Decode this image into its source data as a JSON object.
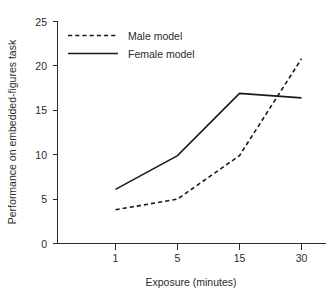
{
  "chart_data": {
    "type": "line",
    "title": "",
    "subtitle": "",
    "xlabel": "Exposure (minutes)",
    "ylabel": "Performance on embedded-figures task",
    "categories": [
      "1",
      "5",
      "15",
      "30"
    ],
    "x_tick_labels": [
      "1",
      "5",
      "15",
      "30"
    ],
    "y_tick_labels": [
      "0",
      "5",
      "10",
      "15",
      "20",
      "25"
    ],
    "y_ticks": [
      0,
      5,
      10,
      15,
      20,
      25
    ],
    "ylim": [
      0,
      25
    ],
    "grid": false,
    "legend_position": "top-left-inside",
    "series": [
      {
        "name": "Male model",
        "style": "dashed",
        "color": "#1a1a1a",
        "values": [
          3.8,
          5.0,
          9.9,
          20.8
        ]
      },
      {
        "name": "Female model",
        "style": "solid",
        "color": "#1a1a1a",
        "values": [
          6.1,
          9.9,
          16.9,
          16.4
        ]
      }
    ],
    "annotations": []
  },
  "legend": {
    "items": [
      {
        "label": "Male model",
        "style": "dashed"
      },
      {
        "label": "Female model",
        "style": "solid"
      }
    ]
  },
  "axes": {
    "x_title": "Exposure (minutes)",
    "y_title": "Performance on embedded-figures task"
  },
  "colors": {
    "line": "#1a1a1a",
    "axis": "#2b2b2b",
    "background": "#ffffff"
  }
}
